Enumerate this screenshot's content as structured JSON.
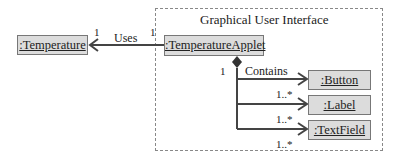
{
  "diagram": {
    "frame_title": "Graphical User Interface",
    "objects": {
      "temperature": ":Temperature",
      "applet": ":TemperatureApplet",
      "button": ":Button",
      "label": ":Label",
      "textfield": ":TextField"
    },
    "associations": {
      "uses": {
        "label": "Uses",
        "mult_left": "1",
        "mult_right": "1"
      },
      "contains": {
        "label": "Contains",
        "mult_owner": "1",
        "mult_button": "1..*",
        "mult_label": "1..*",
        "mult_textfield": "1..*"
      }
    },
    "colors": {
      "box_fill": "#dcdcdc",
      "line": "#444444",
      "frame_border": "#888888"
    }
  }
}
